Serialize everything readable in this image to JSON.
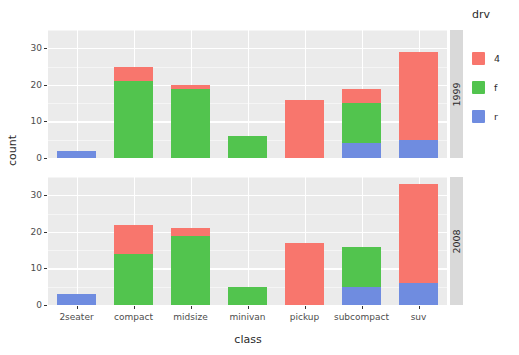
{
  "chart_data": {
    "type": "bar",
    "title": "",
    "subtitle": "",
    "xlabel": "class",
    "ylabel": "count",
    "stacked": true,
    "grid": true,
    "legend_position": "right",
    "legend_title": "drv",
    "facet_variable": "year",
    "facets": [
      "1999",
      "2008"
    ],
    "categories": [
      "2seater",
      "compact",
      "midsize",
      "minivan",
      "pickup",
      "subcompact",
      "suv"
    ],
    "ylim": [
      0,
      35
    ],
    "yticks": [
      0,
      10,
      20,
      30
    ],
    "ytick_labels": [
      "0",
      "10",
      "20",
      "30"
    ],
    "series": [
      {
        "name": "r",
        "color": "#6f8ce0"
      },
      {
        "name": "f",
        "color": "#52c44e"
      },
      {
        "name": "4",
        "color": "#f8766d"
      }
    ],
    "panels": [
      {
        "facet": "1999",
        "stacks": [
          {
            "category": "2seater",
            "r": 2,
            "f": 0,
            "4": 0,
            "total": 2
          },
          {
            "category": "compact",
            "r": 0,
            "f": 21,
            "4": 4,
            "total": 25
          },
          {
            "category": "midsize",
            "r": 0,
            "f": 19,
            "4": 1,
            "total": 20
          },
          {
            "category": "minivan",
            "r": 0,
            "f": 6,
            "4": 0,
            "total": 6
          },
          {
            "category": "pickup",
            "r": 0,
            "f": 0,
            "4": 16,
            "total": 16
          },
          {
            "category": "subcompact",
            "r": 4,
            "f": 11,
            "4": 4,
            "total": 19
          },
          {
            "category": "suv",
            "r": 5,
            "f": 0,
            "4": 24,
            "total": 29
          }
        ]
      },
      {
        "facet": "2008",
        "stacks": [
          {
            "category": "2seater",
            "r": 3,
            "f": 0,
            "4": 0,
            "total": 3
          },
          {
            "category": "compact",
            "r": 0,
            "f": 14,
            "4": 8,
            "total": 22
          },
          {
            "category": "midsize",
            "r": 0,
            "f": 19,
            "4": 2,
            "total": 21
          },
          {
            "category": "minivan",
            "r": 0,
            "f": 5,
            "4": 0,
            "total": 5
          },
          {
            "category": "pickup",
            "r": 0,
            "f": 0,
            "4": 17,
            "total": 17
          },
          {
            "category": "subcompact",
            "r": 5,
            "f": 11,
            "4": 0,
            "total": 16
          },
          {
            "category": "suv",
            "r": 6,
            "f": 0,
            "4": 27,
            "total": 33
          }
        ]
      }
    ]
  },
  "legend": {
    "title": "drv",
    "items": [
      {
        "label": "4",
        "color": "#f8766d"
      },
      {
        "label": "f",
        "color": "#52c44e"
      },
      {
        "label": "r",
        "color": "#6f8ce0"
      }
    ]
  },
  "axes": {
    "y_title": "count",
    "x_title": "class"
  },
  "theme": {
    "panel_background": "#ebebeb",
    "grid_color": "#ffffff",
    "strip_background": "#d9d9d9",
    "text_color": "#4d4d4d",
    "plot_background": "#ffffff"
  }
}
